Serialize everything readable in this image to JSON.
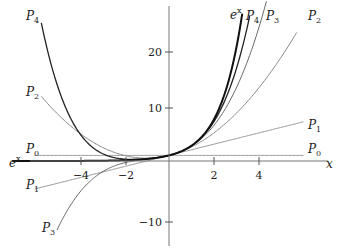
{
  "chart_data": {
    "type": "line",
    "title": "",
    "xlabel": "x",
    "ylabel": "",
    "xlim": [
      -7.0,
      7.3
    ],
    "ylim": [
      -13.5,
      28.5
    ],
    "grid": false,
    "x_ticks": [
      -4,
      -2,
      2,
      4
    ],
    "y_ticks": [
      -10,
      10,
      20
    ],
    "x_tick_labels": [
      "−4",
      "−2",
      "2",
      "4"
    ],
    "y_tick_labels": [
      "−10",
      "10",
      "20"
    ],
    "series": [
      {
        "name": "e^x",
        "label": "e",
        "label_sup": "x",
        "formula": "exp(x)",
        "x_range": [
          -7.0,
          3.27
        ],
        "color": "#111111",
        "width": 2.0
      },
      {
        "name": "P0",
        "label": "P",
        "label_sub": "0",
        "formula": "1",
        "x_range": [
          -6.0,
          6.0
        ],
        "color": "#999999",
        "width": 1.0
      },
      {
        "name": "P1",
        "label": "P",
        "label_sub": "1",
        "formula": "1+x",
        "x_range": [
          -6.0,
          6.0
        ],
        "color": "#999999",
        "width": 1.0
      },
      {
        "name": "P2",
        "label": "P",
        "label_sub": "2",
        "formula": "1+x+x^2/2",
        "x_range": [
          -5.7,
          5.7
        ],
        "color": "#888888",
        "width": 1.0
      },
      {
        "name": "P3",
        "label": "P",
        "label_sub": "3",
        "formula": "1+x+x^2/2+x^3/6",
        "x_range": [
          -5.0,
          4.35
        ],
        "color": "#666666",
        "width": 1.0
      },
      {
        "name": "P4",
        "label": "P",
        "label_sub": "4",
        "formula": "1+x+x^2/2+x^3/6+x^4/24",
        "x_range": [
          -5.7,
          3.6
        ],
        "color": "#222222",
        "width": 1.3
      }
    ],
    "sample_points": {
      "x": [
        -6,
        -4,
        -2,
        0,
        2,
        4,
        6
      ],
      "P0": [
        1,
        1,
        1,
        1,
        1,
        1,
        1
      ],
      "P1": [
        -5,
        -3,
        -1,
        1,
        3,
        5,
        7
      ],
      "P2": [
        13,
        5,
        1,
        1,
        5,
        13,
        25
      ],
      "P3": [
        -23,
        -5.67,
        -0.33,
        1,
        6.33,
        23.67,
        null
      ],
      "P4": [
        31,
        5,
        0.33,
        1,
        7,
        null,
        null
      ],
      "e^x": [
        0.0025,
        0.018,
        0.135,
        1,
        7.39,
        null,
        null
      ]
    }
  },
  "axes": {
    "x_axis_label": "x",
    "tick_labels_x": [
      "−4",
      "−2",
      "2",
      "4"
    ],
    "tick_labels_y": [
      "20",
      "10",
      "−10"
    ]
  },
  "labels": {
    "ex_left": {
      "base": "e",
      "sup": "x"
    },
    "ex_top": {
      "base": "e",
      "sup": "x"
    },
    "p0_left": {
      "base": "P",
      "sub": "0"
    },
    "p0_right": {
      "base": "P",
      "sub": "0"
    },
    "p1_left": {
      "base": "P",
      "sub": "1"
    },
    "p1_right": {
      "base": "P",
      "sub": "1"
    },
    "p2_left": {
      "base": "P",
      "sub": "2"
    },
    "p2_right": {
      "base": "P",
      "sub": "2"
    },
    "p3_left": {
      "base": "P",
      "sub": "3"
    },
    "p3_right": {
      "base": "P",
      "sub": "3"
    },
    "p4_left": {
      "base": "P",
      "sub": "4"
    },
    "p4_right": {
      "base": "P",
      "sub": "4"
    }
  }
}
